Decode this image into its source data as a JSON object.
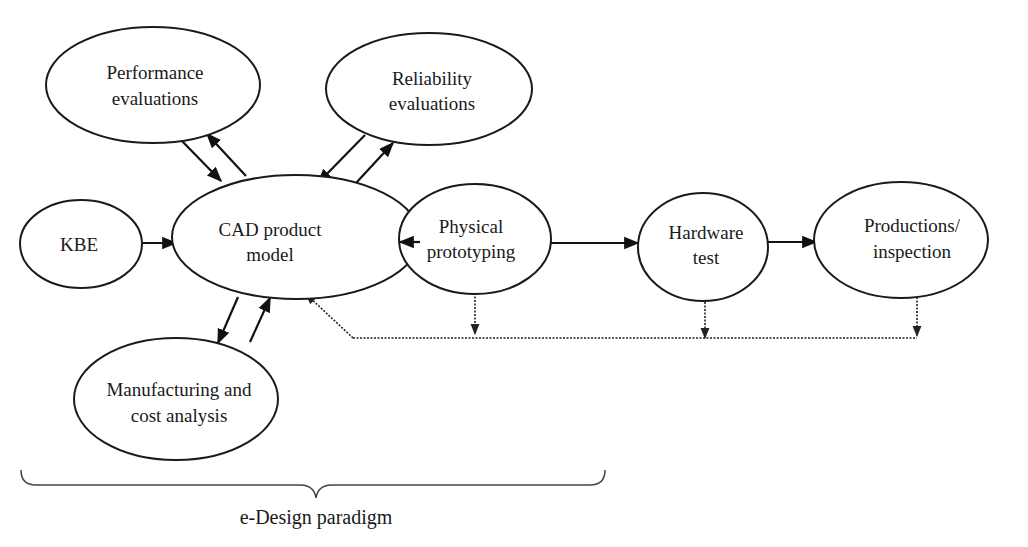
{
  "diagram": {
    "nodes": {
      "performance": {
        "line1": "Performance",
        "line2": "evaluations"
      },
      "reliability": {
        "line1": "Reliability",
        "line2": "evaluations"
      },
      "kbe": {
        "line1": "KBE"
      },
      "cad": {
        "line1": "CAD product",
        "line2": "model"
      },
      "physical": {
        "line1": "Physical",
        "line2": "prototyping"
      },
      "hardware": {
        "line1": "Hardware",
        "line2": "test"
      },
      "productions": {
        "line1": "Productions/",
        "line2": "inspection"
      },
      "manufacturing": {
        "line1": "Manufacturing and",
        "line2": "cost analysis"
      }
    },
    "edges": [
      {
        "from": "kbe",
        "to": "cad",
        "style": "solid"
      },
      {
        "from": "performance",
        "to": "cad",
        "style": "solid"
      },
      {
        "from": "cad",
        "to": "performance",
        "style": "solid"
      },
      {
        "from": "reliability",
        "to": "cad",
        "style": "solid"
      },
      {
        "from": "cad",
        "to": "reliability",
        "style": "solid"
      },
      {
        "from": "cad",
        "to": "manufacturing",
        "style": "solid"
      },
      {
        "from": "manufacturing",
        "to": "cad",
        "style": "solid"
      },
      {
        "from": "cad",
        "to": "physical",
        "style": "solid"
      },
      {
        "from": "physical",
        "to": "hardware",
        "style": "solid"
      },
      {
        "from": "hardware",
        "to": "productions",
        "style": "solid"
      },
      {
        "from": "physical",
        "to": "feedback-line",
        "style": "dotted"
      },
      {
        "from": "hardware",
        "to": "feedback-line",
        "style": "dotted"
      },
      {
        "from": "productions",
        "to": "feedback-line",
        "style": "dotted"
      },
      {
        "from": "feedback-line",
        "to": "cad",
        "style": "dotted"
      }
    ],
    "brace_label": "e-Design paradigm"
  }
}
